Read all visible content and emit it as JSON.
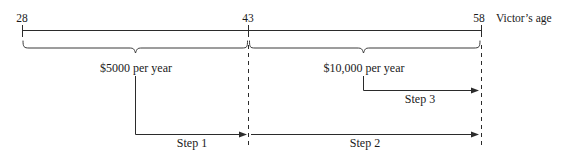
{
  "diagram": {
    "axis": {
      "caption": "Victor’s age",
      "ticks": [
        {
          "value": "28",
          "x": 22
        },
        {
          "value": "43",
          "x": 248
        },
        {
          "value": "58",
          "x": 481
        }
      ]
    },
    "braces": [
      {
        "label": "$5000 per year",
        "from": "28",
        "to": "43"
      },
      {
        "label": "$10,000 per year",
        "from": "43",
        "to": "58"
      }
    ],
    "steps": [
      {
        "label": "Step 1",
        "from": "mid-first-interval",
        "to": "43"
      },
      {
        "label": "Step 2",
        "from": "43",
        "to": "58"
      },
      {
        "label": "Step 3",
        "from": "mid-second-interval",
        "to": "58"
      }
    ],
    "colors": {
      "line": "#2b2b2b",
      "brace": "#3a3a3a",
      "text": "#1a1a1a",
      "background": "#ffffff"
    }
  }
}
